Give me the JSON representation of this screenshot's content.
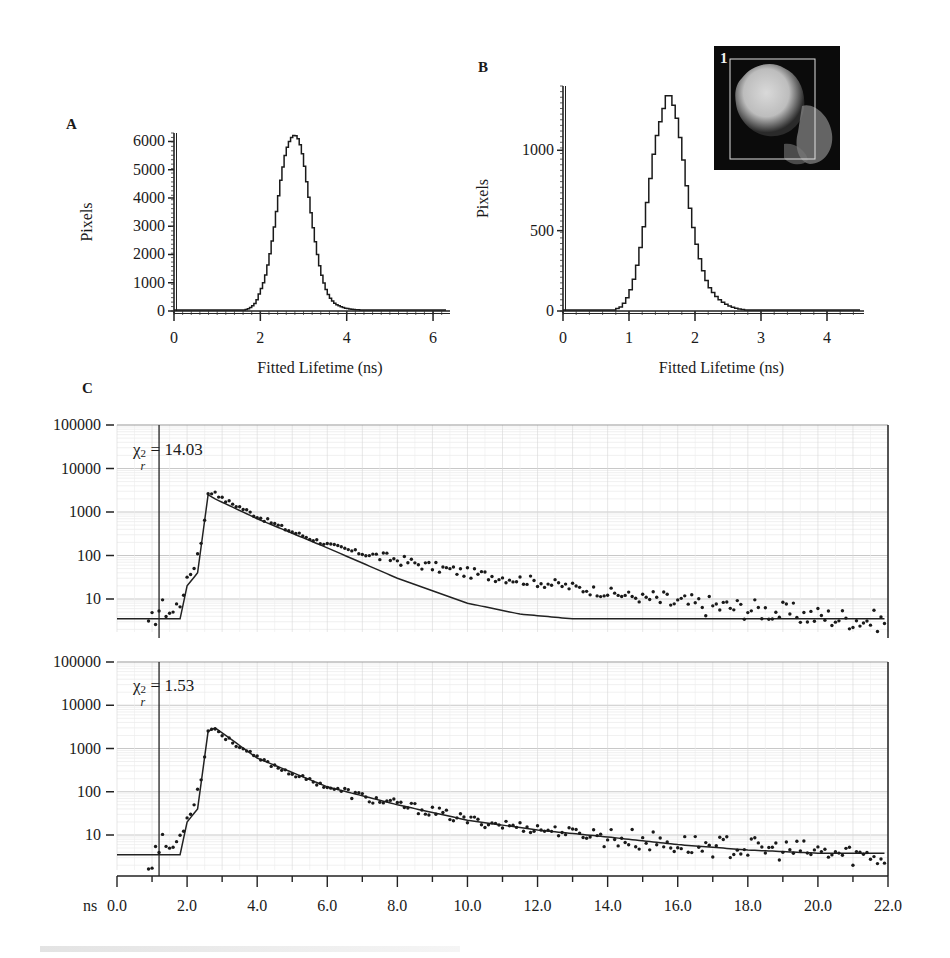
{
  "panels": {
    "A": {
      "label": "A"
    },
    "B": {
      "label": "B"
    },
    "C": {
      "label": "C"
    }
  },
  "inset": {
    "label": "1",
    "description": "grayscale cell image with rectangular ROI"
  },
  "chart_data": [
    {
      "id": "A",
      "type": "bar",
      "subtype": "histogram-step",
      "title": "",
      "xlabel": "Fitted Lifetime (ns)",
      "ylabel": "Pixels",
      "xlim": [
        0,
        6.3
      ],
      "ylim": [
        0,
        6300
      ],
      "xticks": [
        "0",
        "2",
        "4",
        "6"
      ],
      "yticks": [
        "0",
        "1000",
        "2000",
        "3000",
        "4000",
        "5000",
        "6000"
      ],
      "grid": false,
      "x": [
        1.5,
        1.7,
        1.8,
        1.9,
        2.0,
        2.1,
        2.2,
        2.3,
        2.4,
        2.5,
        2.6,
        2.7,
        2.8,
        2.9,
        3.0,
        3.1,
        3.2,
        3.3,
        3.4,
        3.5,
        3.6,
        3.7,
        3.8,
        3.9,
        4.0,
        4.2,
        4.5,
        4.8,
        5.0
      ],
      "values": [
        0,
        60,
        150,
        300,
        700,
        1100,
        1800,
        2700,
        3800,
        4900,
        5700,
        6100,
        6250,
        6050,
        5400,
        4300,
        3200,
        2200,
        1400,
        850,
        500,
        300,
        200,
        130,
        90,
        50,
        25,
        10,
        0
      ]
    },
    {
      "id": "B",
      "type": "bar",
      "subtype": "histogram-step",
      "title": "",
      "xlabel": "Fitted Lifetime (ns)",
      "ylabel": "Pixels",
      "xlim": [
        0,
        4.5
      ],
      "ylim": [
        0,
        1400
      ],
      "xticks": [
        "0",
        "1",
        "2",
        "3",
        "4"
      ],
      "yticks": [
        "0",
        "500",
        "1000"
      ],
      "grid": false,
      "x": [
        0.8,
        0.9,
        1.0,
        1.1,
        1.2,
        1.3,
        1.4,
        1.5,
        1.55,
        1.6,
        1.65,
        1.7,
        1.8,
        1.9,
        2.0,
        2.1,
        2.2,
        2.3,
        2.4,
        2.5,
        2.6,
        2.7,
        2.8,
        3.0
      ],
      "values": [
        10,
        30,
        100,
        230,
        450,
        750,
        1050,
        1220,
        1300,
        1380,
        1300,
        1260,
        1020,
        700,
        460,
        280,
        160,
        100,
        60,
        35,
        20,
        10,
        5,
        5
      ]
    },
    {
      "id": "C-top",
      "type": "scatter",
      "title": "",
      "annotation": "χr² = 14.03",
      "chi_sq": "14.03",
      "xlabel": "ns",
      "ylabel": "",
      "yscale": "log",
      "xlim": [
        0,
        22
      ],
      "ylim": [
        1,
        100000
      ],
      "xticks": [
        "0.0",
        "2.0",
        "4.0",
        "6.0",
        "8.0",
        "10.0",
        "12.0",
        "14.0",
        "16.0",
        "18.0",
        "20.0",
        "22.0"
      ],
      "yticks": [
        "10",
        "100",
        "1000",
        "10000",
        "100000"
      ],
      "grid": true,
      "series": [
        {
          "name": "data",
          "x": [
            0.9,
            1.0,
            1.2,
            1.4,
            1.6,
            1.8,
            2.0,
            2.2,
            2.4,
            2.6,
            2.8,
            3.0,
            3.5,
            4.0,
            5.0,
            6.0,
            7.0,
            8.0,
            9.0,
            10.0,
            12.0,
            14.0,
            16.0,
            18.0,
            20.0,
            22.0
          ],
          "values": [
            2,
            3,
            6,
            6,
            5,
            9,
            25,
            60,
            200,
            2500,
            3000,
            2000,
            1300,
            800,
            350,
            180,
            110,
            80,
            55,
            40,
            25,
            14,
            8,
            6,
            4,
            3
          ]
        },
        {
          "name": "single-exponential fit",
          "x": [
            0,
            1.8,
            2.0,
            2.3,
            2.6,
            2.8,
            4.0,
            6.0,
            8.0,
            10.0,
            11.5,
            13.0,
            22.0
          ],
          "values": [
            3.5,
            3.5,
            20,
            40,
            2500,
            2000,
            700,
            150,
            30,
            8,
            4.5,
            3.5,
            3.5
          ]
        }
      ]
    },
    {
      "id": "C-bottom",
      "type": "scatter",
      "title": "",
      "annotation": "χr² = 1.53",
      "chi_sq": "1.53",
      "xlabel": "ns",
      "ylabel": "",
      "yscale": "log",
      "xlim": [
        0,
        22
      ],
      "ylim": [
        1,
        100000
      ],
      "xticks": [
        "0.0",
        "2.0",
        "4.0",
        "6.0",
        "8.0",
        "10.0",
        "12.0",
        "14.0",
        "16.0",
        "18.0",
        "20.0",
        "22.0"
      ],
      "yticks": [
        "10",
        "100",
        "1000",
        "10000",
        "100000"
      ],
      "grid": true,
      "series": [
        {
          "name": "data",
          "x": [
            0.9,
            1.0,
            1.2,
            1.4,
            1.6,
            1.8,
            2.0,
            2.2,
            2.4,
            2.6,
            2.8,
            3.0,
            3.5,
            4.0,
            5.0,
            6.0,
            7.0,
            8.0,
            9.0,
            10.0,
            12.0,
            14.0,
            16.0,
            18.0,
            20.0,
            22.0
          ],
          "values": [
            2,
            3,
            6,
            6,
            5,
            9,
            25,
            60,
            200,
            2500,
            3000,
            2000,
            1100,
            600,
            260,
            130,
            75,
            50,
            35,
            22,
            14,
            9,
            6,
            5,
            4,
            3
          ]
        },
        {
          "name": "bi-exponential fit",
          "x": [
            0,
            1.8,
            2.0,
            2.3,
            2.6,
            2.8,
            4.0,
            6.0,
            8.0,
            10.0,
            12.0,
            14.0,
            16.0,
            18.0,
            20.0,
            22.0
          ],
          "values": [
            3.5,
            3.5,
            20,
            40,
            2500,
            3000,
            600,
            130,
            50,
            22,
            13,
            9,
            6,
            4.5,
            3.8,
            3.8
          ]
        }
      ]
    }
  ]
}
